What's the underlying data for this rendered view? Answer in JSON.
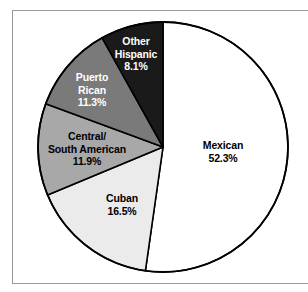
{
  "figure": {
    "background_color": "#ffffff",
    "frame_color": "#9a9a9a",
    "outline_color": "#000000"
  },
  "chart_data": {
    "type": "pie",
    "title": "",
    "subtitle": "",
    "xlabel": "",
    "ylabel": "",
    "legend_position": "none",
    "grid": false,
    "units": "percent",
    "start_angle_deg": 90,
    "direction": "clockwise",
    "total": 100.1,
    "categories": [
      "Mexican",
      "Cuban",
      "Central/ South American",
      "Puerto Rican",
      "Other Hispanic"
    ],
    "values": [
      52.3,
      16.5,
      11.9,
      11.3,
      8.1
    ],
    "slice_colors": [
      "#ffffff",
      "#ebebeb",
      "#a8a8a8",
      "#7a7a7a",
      "#1a1a1a"
    ],
    "slices": [
      {
        "label": "Mexican",
        "label_line1": "Mexican",
        "value": 52.3,
        "value_text": "52.3%",
        "color": "#ffffff",
        "text_color": "#000000"
      },
      {
        "label": "Cuban",
        "label_line1": "Cuban",
        "value": 16.5,
        "value_text": "16.5%",
        "color": "#ebebeb",
        "text_color": "#000000"
      },
      {
        "label": "Central/ South American",
        "label_line1": "Central/",
        "label_line2": "South American",
        "value": 11.9,
        "value_text": "11.9%",
        "color": "#a8a8a8",
        "text_color": "#000000"
      },
      {
        "label": "Puerto Rican",
        "label_line1": "Puerto",
        "label_line2": "Rican",
        "value": 11.3,
        "value_text": "11.3%",
        "color": "#7a7a7a",
        "text_color": "#ffffff"
      },
      {
        "label": "Other Hispanic",
        "label_line1": "Other",
        "label_line2": "Hispanic",
        "value": 8.1,
        "value_text": "8.1%",
        "color": "#1a1a1a",
        "text_color": "#ffffff"
      }
    ]
  }
}
